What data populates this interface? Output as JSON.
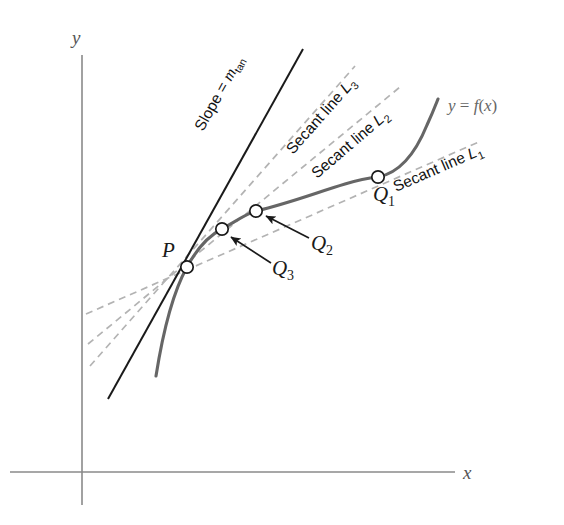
{
  "figure": {
    "axes": {
      "x_label": "x",
      "y_label": "y",
      "axis_color": "#808080"
    },
    "curve": {
      "label": "y = f(x)",
      "label_parts": {
        "y": "y",
        "equals": " = ",
        "f": "f",
        "open": "(",
        "x": "x",
        "close": ")"
      },
      "color": "#666666"
    },
    "tangent": {
      "slope_label_prefix": "Slope = ",
      "slope_label_var": "m",
      "slope_label_sub": "tan",
      "color": "#1a1a1a"
    },
    "secants": [
      {
        "name": "secant-L1",
        "label": "Secant line ",
        "sub": "L",
        "sub_index": "1",
        "color": "#b0b0b0"
      },
      {
        "name": "secant-L2",
        "label": "Secant line ",
        "sub": "L",
        "sub_index": "2",
        "color": "#b0b0b0"
      },
      {
        "name": "secant-L3",
        "label": "Secant line ",
        "sub": "L",
        "sub_index": "3",
        "color": "#b0b0b0"
      }
    ],
    "points": [
      {
        "name": "point-P",
        "label": "P",
        "sub": "",
        "x": 187,
        "y": 267
      },
      {
        "name": "point-Q1",
        "label": "Q",
        "sub": "1",
        "x": 378,
        "y": 177
      },
      {
        "name": "point-Q2",
        "label": "Q",
        "sub": "2",
        "x": 256,
        "y": 211
      },
      {
        "name": "point-Q3",
        "label": "Q",
        "sub": "3",
        "x": 222,
        "y": 229
      }
    ],
    "colors": {
      "background": "#ffffff",
      "curve": "#666666",
      "tangent": "#1a1a1a",
      "secant_dash": "#b3b3b3",
      "axis": "#8a8a8a",
      "text": "#111111"
    }
  }
}
